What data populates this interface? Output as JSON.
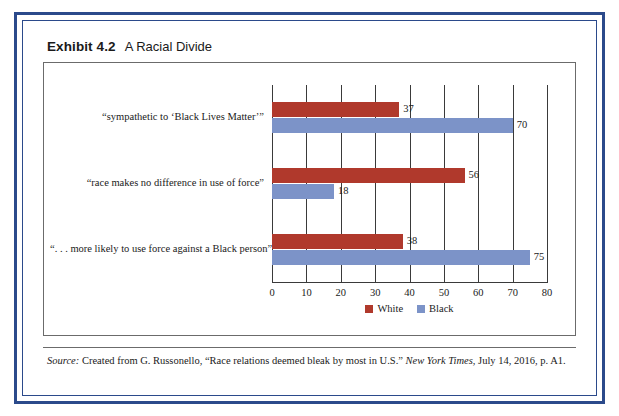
{
  "exhibit": {
    "label": "Exhibit 4.2",
    "title": "A Racial Divide"
  },
  "source": {
    "prefix": "Source:",
    "body_1": " Created from G. Russonello, “Race relations deemed bleak by most in U.S.” ",
    "publication": "New York Times,",
    "body_2": " July 14, 2016, p. A1."
  },
  "colors": {
    "white_series": "#b0392c",
    "black_series": "#7c93c8",
    "frame": "#2b4a8b",
    "axis": "#3a3a3a"
  },
  "chart_data": {
    "type": "bar",
    "orientation": "horizontal",
    "title": "A Racial Divide",
    "xlabel": "",
    "ylabel": "",
    "xlim": [
      0,
      80
    ],
    "xticks": [
      0,
      10,
      20,
      30,
      40,
      50,
      60,
      70,
      80
    ],
    "grid": true,
    "legend_position": "bottom",
    "categories": [
      "“sympathetic to ‘Black Lives Matter’”",
      "“race makes no difference in use of force”",
      "“. . . more likely to use force against a Black person”"
    ],
    "series": [
      {
        "name": "White",
        "values": [
          37,
          56,
          38
        ]
      },
      {
        "name": "Black",
        "values": [
          70,
          18,
          75
        ]
      }
    ]
  }
}
